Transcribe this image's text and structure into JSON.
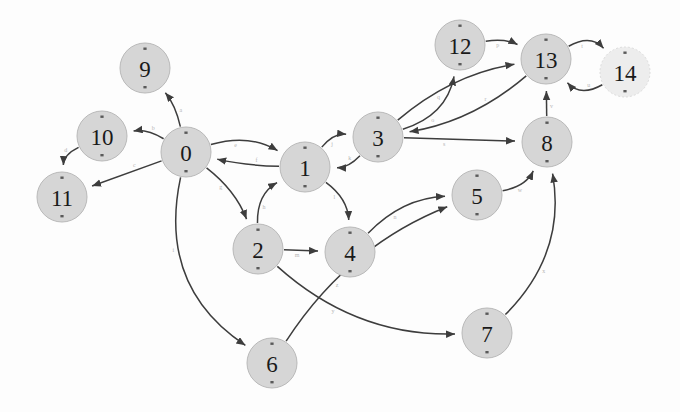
{
  "graph": {
    "title": "state transition graph",
    "canvas": {
      "width": 680,
      "height": 412
    },
    "style": {
      "background": "#fdfdfd",
      "node_fill": "#d6d6d6",
      "node_fill_faded": "#ededed",
      "node_stroke": "#b9b9b9",
      "node_label_color": "#1a1a1a",
      "edge_color": "#3d3d3d",
      "edge_label_color": "#b5b5b5"
    },
    "nodes": [
      {
        "id": "0",
        "label": "0",
        "cx": 186,
        "cy": 152,
        "r": 25,
        "faded": false
      },
      {
        "id": "1",
        "label": "1",
        "cx": 305,
        "cy": 167,
        "r": 25,
        "faded": false
      },
      {
        "id": "2",
        "label": "2",
        "cx": 258,
        "cy": 249,
        "r": 25,
        "faded": false
      },
      {
        "id": "3",
        "label": "3",
        "cx": 378,
        "cy": 137,
        "r": 25,
        "faded": false
      },
      {
        "id": "4",
        "label": "4",
        "cx": 350,
        "cy": 252,
        "r": 25,
        "faded": false
      },
      {
        "id": "5",
        "label": "5",
        "cx": 477,
        "cy": 195,
        "r": 25,
        "faded": false
      },
      {
        "id": "6",
        "label": "6",
        "cx": 272,
        "cy": 363,
        "r": 25,
        "faded": false
      },
      {
        "id": "7",
        "label": "7",
        "cx": 487,
        "cy": 333,
        "r": 25,
        "faded": false
      },
      {
        "id": "8",
        "label": "8",
        "cx": 547,
        "cy": 142,
        "r": 25,
        "faded": false
      },
      {
        "id": "9",
        "label": "9",
        "cx": 145,
        "cy": 68,
        "r": 25,
        "faded": false
      },
      {
        "id": "10",
        "label": "10",
        "cx": 102,
        "cy": 136,
        "r": 25,
        "faded": false
      },
      {
        "id": "11",
        "label": "11",
        "cx": 62,
        "cy": 197,
        "r": 25,
        "faded": false
      },
      {
        "id": "12",
        "label": "12",
        "cx": 460,
        "cy": 45,
        "r": 25,
        "faded": false
      },
      {
        "id": "13",
        "label": "13",
        "cx": 546,
        "cy": 59,
        "r": 25,
        "faded": false
      },
      {
        "id": "14",
        "label": "14",
        "cx": 625,
        "cy": 72,
        "r": 25,
        "faded": true
      }
    ],
    "edges": [
      {
        "from": "0",
        "to": "9",
        "curve": 0.12,
        "label": "a"
      },
      {
        "from": "0",
        "to": "10",
        "curve": 0.18,
        "label": "b"
      },
      {
        "from": "0",
        "to": "11",
        "curve": 0.0,
        "label": "c"
      },
      {
        "from": "10",
        "to": "11",
        "curve": 0.3,
        "label": "d"
      },
      {
        "from": "0",
        "to": "1",
        "curve": -0.22,
        "label": "e"
      },
      {
        "from": "1",
        "to": "0",
        "curve": -0.05,
        "label": "f"
      },
      {
        "from": "0",
        "to": "2",
        "curve": -0.14,
        "label": "g"
      },
      {
        "from": "2",
        "to": "1",
        "curve": -0.3,
        "label": "h"
      },
      {
        "from": "0",
        "to": "6",
        "curve": 0.34,
        "label": "i"
      },
      {
        "from": "1",
        "to": "3",
        "curve": -0.26,
        "label": "j"
      },
      {
        "from": "3",
        "to": "1",
        "curve": -0.22,
        "label": "k"
      },
      {
        "from": "1",
        "to": "4",
        "curve": -0.24,
        "label": "l"
      },
      {
        "from": "2",
        "to": "4",
        "curve": 0.0,
        "label": "m"
      },
      {
        "from": "4",
        "to": "5",
        "curve": -0.2,
        "label": "n"
      },
      {
        "from": "3",
        "to": "12",
        "curve": 0.3,
        "label": "o"
      },
      {
        "from": "12",
        "to": "13",
        "curve": -0.16,
        "label": "p"
      },
      {
        "from": "3",
        "to": "13",
        "curve": -0.14,
        "label": "q"
      },
      {
        "from": "13",
        "to": "3",
        "curve": -0.14,
        "label": "r"
      },
      {
        "from": "3",
        "to": "8",
        "curve": 0.0,
        "label": "s"
      },
      {
        "from": "13",
        "to": "14",
        "curve": -0.4,
        "label": "t"
      },
      {
        "from": "14",
        "to": "13",
        "curve": -0.4,
        "label": "u"
      },
      {
        "from": "8",
        "to": "13",
        "curve": 0.0,
        "label": "v"
      },
      {
        "from": "5",
        "to": "8",
        "curve": 0.26,
        "label": "w"
      },
      {
        "from": "7",
        "to": "8",
        "curve": 0.26,
        "label": "x"
      },
      {
        "from": "2",
        "to": "7",
        "curve": 0.2,
        "label": "y"
      },
      {
        "from": "6",
        "to": "5",
        "curve": -0.16,
        "label": "z"
      }
    ]
  }
}
